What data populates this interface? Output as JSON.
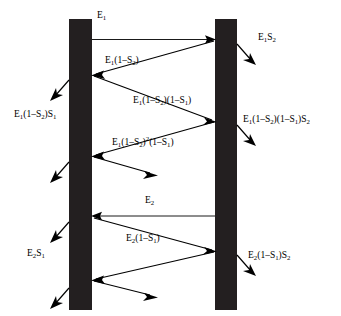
{
  "diagram": {
    "colors": {
      "bar": "#231f20",
      "ray": "#000000",
      "background": "#ffffff"
    },
    "surfaces": [
      {
        "name": "left-surface",
        "x": 69,
        "y": 19,
        "width": 23,
        "height": 291
      },
      {
        "name": "right-surface",
        "x": 215,
        "y": 19,
        "width": 22,
        "height": 291
      }
    ],
    "labels": {
      "incident_1": "E1",
      "incident_1_html": "E<sub>1</sub>",
      "transmit_right_1": "E1S2",
      "transmit_right_1_html": "E<sub>1</sub>S<sub>2</sub>",
      "internal_1": "E1(1-S2)",
      "internal_1_html": "E<sub>1</sub>(1–S<sub>2</sub>)",
      "transmit_left_1": "E1(1-S2)S1",
      "transmit_left_1_html": "E<sub>1</sub>(1–S<sub>2</sub>)S<sub>1</sub>",
      "internal_2": "E1(1-S2)(1-S1)",
      "internal_2_html": "E<sub>1</sub>(1–S<sub>2</sub>)(1–S<sub>1</sub>)",
      "transmit_right_2": "E1(1-S2)(1-S1)S2",
      "transmit_right_2_html": "E<sub>1</sub>(1–S<sub>2</sub>)(1–S<sub>1</sub>)S<sub>2</sub>",
      "internal_3": "E1(1-S2)^2(1-S1)",
      "internal_3_html": "E<sub>1</sub>(1–S<sub>2</sub>)<sup>2</sup>(1–S<sub>1</sub>)",
      "incident_2": "E2",
      "incident_2_html": "E<sub>2</sub>",
      "transmit_left_2": "E2S1",
      "transmit_left_2_html": "E<sub>2</sub>S<sub>1</sub>",
      "internal_4": "E2(1-S1)",
      "internal_4_html": "E<sub>2</sub>(1–S<sub>1</sub>)",
      "transmit_right_3": "E2(1-S1)S2",
      "transmit_right_3_html": "E<sub>2</sub>(1–S<sub>1</sub>)S<sub>2</sub>"
    }
  }
}
